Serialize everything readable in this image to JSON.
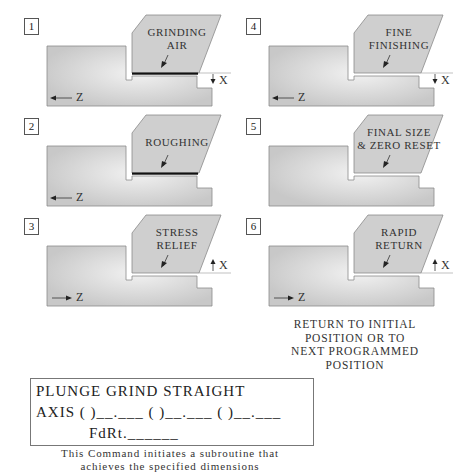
{
  "panels": [
    {
      "number": "1",
      "label_lines": [
        "GRINDING",
        "AIR"
      ],
      "z_dir": "left",
      "x_dir": "down",
      "dark_gap": true,
      "wheel_dx": 0,
      "wheel_dy": 0
    },
    {
      "number": "2",
      "label_lines": [
        "ROUGHING",
        ""
      ],
      "z_dir": "left",
      "x_dir": "none",
      "dark_gap": true,
      "wheel_dx": 0,
      "wheel_dy": 0
    },
    {
      "number": "3",
      "label_lines": [
        "STRESS",
        "RELIEF"
      ],
      "z_dir": "right",
      "x_dir": "up",
      "dark_gap": false,
      "wheel_dx": 0,
      "wheel_dy": 0
    },
    {
      "number": "4",
      "label_lines": [
        "FINE",
        "FINISHING"
      ],
      "z_dir": "left",
      "x_dir": "down",
      "dark_gap": false,
      "wheel_dx": 0,
      "wheel_dy": 0
    },
    {
      "number": "5",
      "label_lines": [
        "FINAL SIZE",
        "& ZERO RESET"
      ],
      "z_dir": "none",
      "x_dir": "none",
      "dark_gap": false,
      "wheel_dx": 0,
      "wheel_dy": 0
    },
    {
      "number": "6",
      "label_lines": [
        "RAPID",
        "RETURN"
      ],
      "z_dir": "right",
      "x_dir": "up",
      "dark_gap": false,
      "wheel_dx": 0,
      "wheel_dy": 0
    }
  ],
  "axes": {
    "z": "Z",
    "x": "X"
  },
  "return_note": [
    "RETURN TO INITIAL",
    "POSITION OR TO",
    "NEXT PROGRAMMED",
    "POSITION"
  ],
  "command": {
    "title": "PLUNGE GRIND STRAIGHT",
    "axis_line": "AXIS ( )__.___ ( )__.___ ( )__.___",
    "feed_line": "FdRt.______"
  },
  "caption": [
    "This Command initiates a subroutine that",
    "achieves the specified dimensions"
  ],
  "colors": {
    "workpiece": "#c8c8c8",
    "workpiece_light": "#f2f2f2",
    "wheel": "#cfcfcf",
    "outline": "#8a8a8a",
    "gap": "#111111"
  }
}
